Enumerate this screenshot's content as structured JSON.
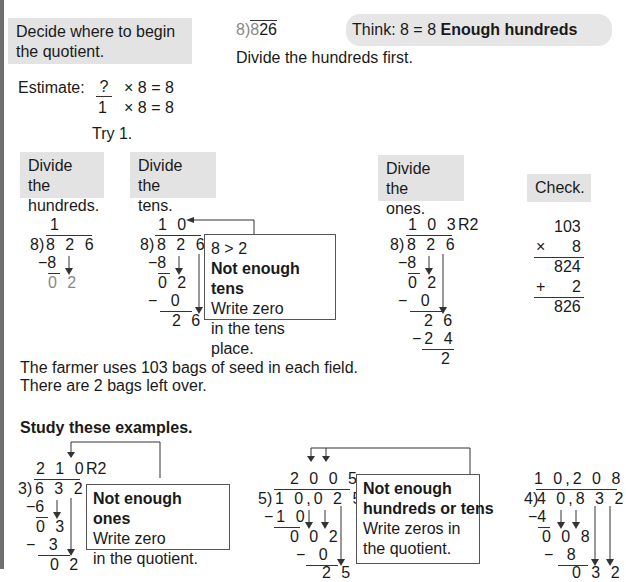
{
  "intro": {
    "step_box": "Decide where to begin the quotient.",
    "step_box_line1": "Decide where to begin",
    "step_box_line2": "the quotient.",
    "problem_divisor": "8",
    "problem_dividend_first": "8",
    "problem_dividend_rest": "26",
    "think_prefix": "Think: 8 = 8",
    "think_bold": "Enough hundreds",
    "divide_first": "Divide the hundreds first.",
    "estimate_label": "Estimate:",
    "estimate_line1": "?  × 8 = 8",
    "estimate_q": "?",
    "estimate_rest1": "× 8 = 8",
    "estimate_a": "1",
    "estimate_rest2": "× 8 = 8",
    "try": "Try 1."
  },
  "steps": [
    {
      "line1": "Divide the",
      "line2": "hundreds."
    },
    {
      "line1": "Divide the",
      "line2": "tens."
    },
    {
      "line1": "Divide the",
      "line2": "ones."
    },
    {
      "line1": "Check.",
      "line2": ""
    }
  ],
  "hundreds_work": {
    "quotient": "1",
    "divisor": "8)",
    "dividend": "8 2 6",
    "sub": "−8",
    "rem": "0 2"
  },
  "tens_work": {
    "quotient": "1 0",
    "divisor": "8)",
    "dividend": "8 2 6",
    "sub1": "−8",
    "rem1": "0 2",
    "sub2": "−   0",
    "rem2": "2 6"
  },
  "tens_note": {
    "line1": "8 > 2",
    "line2": "Not enough tens",
    "line3": "Write zero",
    "line4": "in the tens place."
  },
  "ones_work": {
    "quotient": "1 0 3",
    "remainder": "R2",
    "divisor": "8)",
    "dividend": "8 2 6",
    "sub1": "−8",
    "rem1": "0 2",
    "sub2": "−   0",
    "rem2": "2 6",
    "sub3": "−2 4",
    "rem3": "2"
  },
  "check": {
    "a": "103",
    "op1": "×",
    "b": "8",
    "prod": "824",
    "op2": "+",
    "c": "2",
    "sum": "826"
  },
  "conclusion": {
    "line1": "The farmer uses 103 bags of seed in each field.",
    "line2": "There are 2 bags left over."
  },
  "examples": {
    "heading": "Study these examples.",
    "ex1": {
      "quotient": "2 1 0",
      "remainder": "R2",
      "divisor": "3)",
      "dividend": "6 3 2",
      "sub1": "−6",
      "rem1": "0 3",
      "sub2": "−   3",
      "rem2": "0 2",
      "note_bold": "Not enough ones",
      "note_line2": "Write zero",
      "note_line3": "in the quotient."
    },
    "ex2": {
      "quotient": "2 0 0 5",
      "divisor": "5)",
      "dividend": "1 0,0 2 5",
      "sub1": "−1 0",
      "rem1": "0 0 2",
      "sub2": "−   0",
      "rem2": "2 5",
      "note_bold1": "Not enough",
      "note_bold2": "hundreds or tens",
      "note_line3": "Write zeros in",
      "note_line4": "the quotient."
    },
    "ex3": {
      "quotient": "1 0,2 0 8",
      "divisor": "4)",
      "dividend": "4 0,8 3 2",
      "sub1": "−4",
      "rem1": "0 0 8",
      "sub2": "−   8",
      "rem2": "0 3 2"
    }
  }
}
